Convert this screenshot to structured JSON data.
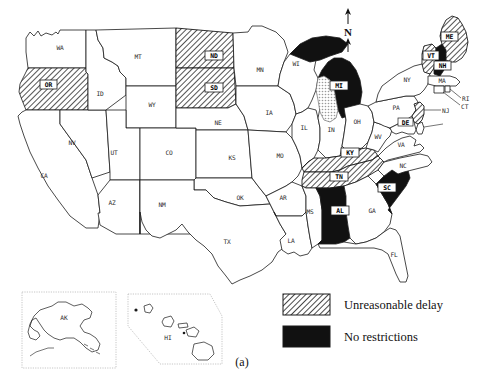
{
  "figure": {
    "caption": "(a)",
    "north_arrow_label": "N",
    "colors": {
      "outline": "#1a1a1a",
      "fill_none": "#ffffff",
      "fill_no_restrictions": "#111111",
      "hatch_stroke": "#1a1a1a",
      "background": "#ffffff",
      "lake_fill": "#d8d8d8"
    }
  },
  "legend": {
    "items": [
      {
        "label": "Unreasonable delay",
        "pattern": "hatch"
      },
      {
        "label": "No restrictions",
        "pattern": "solid-black"
      }
    ]
  },
  "insets": [
    {
      "name": "AK",
      "label": "AK",
      "shape": "rectangle"
    },
    {
      "name": "HI",
      "label": "HI",
      "shape": "hexagon"
    }
  ],
  "map": {
    "title": "",
    "categories": {
      "hatch": "Unreasonable delay",
      "black": "No restrictions",
      "white": "Other / not highlighted"
    },
    "states": [
      {
        "code": "WA",
        "label": "WA",
        "fill": "white",
        "boxed": false,
        "label_x": 60,
        "label_y": 50
      },
      {
        "code": "OR",
        "label": "OR",
        "fill": "hatch",
        "boxed": true,
        "label_x": 49,
        "label_y": 86
      },
      {
        "code": "CA",
        "label": "CA",
        "fill": "white",
        "boxed": false,
        "label_x": 44,
        "label_y": 178
      },
      {
        "code": "NV",
        "label": "NV",
        "fill": "white",
        "boxed": false,
        "label_x": 72,
        "label_y": 145
      },
      {
        "code": "ID",
        "label": "ID",
        "fill": "white",
        "boxed": false,
        "label_x": 100,
        "label_y": 96
      },
      {
        "code": "MT",
        "label": "MT",
        "fill": "white",
        "boxed": false,
        "label_x": 138,
        "label_y": 59
      },
      {
        "code": "WY",
        "label": "WY",
        "fill": "white",
        "boxed": false,
        "label_x": 152,
        "label_y": 107
      },
      {
        "code": "UT",
        "label": "UT",
        "fill": "white",
        "boxed": false,
        "label_x": 114,
        "label_y": 155
      },
      {
        "code": "AZ",
        "label": "AZ",
        "fill": "white",
        "boxed": false,
        "label_x": 112,
        "label_y": 205
      },
      {
        "code": "NM",
        "label": "NM",
        "fill": "white",
        "boxed": false,
        "label_x": 162,
        "label_y": 207
      },
      {
        "code": "CO",
        "label": "CO",
        "fill": "white",
        "boxed": false,
        "label_x": 169,
        "label_y": 155
      },
      {
        "code": "ND",
        "label": "ND",
        "fill": "hatch",
        "boxed": true,
        "label_x": 214,
        "label_y": 58
      },
      {
        "code": "SD",
        "label": "SD",
        "fill": "hatch",
        "boxed": true,
        "label_x": 214,
        "label_y": 90
      },
      {
        "code": "NE",
        "label": "NE",
        "fill": "white",
        "boxed": false,
        "label_x": 218,
        "label_y": 125
      },
      {
        "code": "KS",
        "label": "KS",
        "fill": "white",
        "boxed": false,
        "label_x": 232,
        "label_y": 160
      },
      {
        "code": "OK",
        "label": "OK",
        "fill": "white",
        "boxed": false,
        "label_x": 240,
        "label_y": 200
      },
      {
        "code": "TX",
        "label": "TX",
        "fill": "white",
        "boxed": false,
        "label_x": 227,
        "label_y": 244
      },
      {
        "code": "MN",
        "label": "MN",
        "fill": "white",
        "boxed": false,
        "label_x": 260,
        "label_y": 72
      },
      {
        "code": "IA",
        "label": "IA",
        "fill": "white",
        "boxed": false,
        "label_x": 269,
        "label_y": 115
      },
      {
        "code": "MO",
        "label": "MO",
        "fill": "white",
        "boxed": false,
        "label_x": 280,
        "label_y": 158
      },
      {
        "code": "AR",
        "label": "AR",
        "fill": "white",
        "boxed": false,
        "label_x": 283,
        "label_y": 200
      },
      {
        "code": "LA",
        "label": "LA",
        "fill": "white",
        "boxed": false,
        "label_x": 291,
        "label_y": 243
      },
      {
        "code": "WI",
        "label": "WI",
        "fill": "white",
        "boxed": false,
        "label_x": 296,
        "label_y": 66
      },
      {
        "code": "IL",
        "label": "IL",
        "fill": "white",
        "boxed": false,
        "label_x": 304,
        "label_y": 130
      },
      {
        "code": "IN",
        "label": "IN",
        "fill": "white",
        "boxed": false,
        "label_x": 330,
        "label_y": 130
      },
      {
        "code": "MI",
        "label": "MI",
        "fill": "black",
        "boxed": true,
        "label_x": 338,
        "label_y": 88
      },
      {
        "code": "OH",
        "label": "OH",
        "fill": "white",
        "boxed": false,
        "label_x": 357,
        "label_y": 122
      },
      {
        "code": "KY",
        "label": "KY",
        "fill": "hatch",
        "boxed": true,
        "label_x": 350,
        "label_y": 155
      },
      {
        "code": "TN",
        "label": "TN",
        "fill": "hatch",
        "boxed": true,
        "label_x": 339,
        "label_y": 179
      },
      {
        "code": "MS",
        "label": "MS",
        "fill": "white",
        "boxed": false,
        "label_x": 310,
        "label_y": 214
      },
      {
        "code": "AL",
        "label": "AL",
        "fill": "black",
        "boxed": true,
        "label_x": 340,
        "label_y": 213
      },
      {
        "code": "GA",
        "label": "GA",
        "fill": "white",
        "boxed": false,
        "label_x": 372,
        "label_y": 213
      },
      {
        "code": "FL",
        "label": "FL",
        "fill": "white",
        "boxed": false,
        "label_x": 394,
        "label_y": 257
      },
      {
        "code": "SC",
        "label": "SC",
        "fill": "black",
        "boxed": true,
        "label_x": 387,
        "label_y": 190
      },
      {
        "code": "NC",
        "label": "NC",
        "fill": "white",
        "boxed": false,
        "label_x": 400,
        "label_y": 168
      },
      {
        "code": "VA",
        "label": "VA",
        "fill": "white",
        "boxed": false,
        "label_x": 401,
        "label_y": 143
      },
      {
        "code": "WV",
        "label": "WV",
        "fill": "white",
        "boxed": false,
        "label_x": 376,
        "label_y": 139
      },
      {
        "code": "PA",
        "label": "PA",
        "fill": "white",
        "boxed": false,
        "label_x": 398,
        "label_y": 107
      },
      {
        "code": "NY",
        "label": "NY",
        "fill": "white",
        "boxed": false,
        "label_x": 407,
        "label_y": 80
      },
      {
        "code": "ME",
        "label": "ME",
        "fill": "hatch",
        "boxed": true,
        "label_x": 446,
        "label_y": 39
      },
      {
        "code": "VT",
        "label": "VT",
        "fill": "hatch",
        "boxed": true,
        "label_x": 431,
        "label_y": 58
      },
      {
        "code": "NH",
        "label": "NH",
        "fill": "black",
        "boxed": true,
        "label_x": 442,
        "label_y": 67
      },
      {
        "code": "NJ",
        "label": "NJ",
        "fill": "hatch",
        "boxed": false,
        "label_x": 444,
        "label_y": 111
      },
      {
        "code": "MA",
        "label": "MA",
        "fill": "white",
        "boxed": false,
        "label_x": 440,
        "label_y": 80
      },
      {
        "code": "RI",
        "label": "RI",
        "fill": "white",
        "boxed": false,
        "label_x": 464,
        "label_y": 99
      },
      {
        "code": "CT",
        "label": "CT",
        "fill": "white",
        "boxed": false,
        "label_x": 463,
        "label_y": 107
      },
      {
        "code": "MD",
        "label": "MD",
        "fill": "white",
        "boxed": false,
        "label_x": 408,
        "label_y": 124
      },
      {
        "code": "DE",
        "label": "DE",
        "fill": "white",
        "boxed": false,
        "label_x": 446,
        "label_y": 125
      }
    ],
    "highlighted": {
      "unreasonable_delay": [
        "OR",
        "ND",
        "SD",
        "KY",
        "TN",
        "ME",
        "VT",
        "NJ"
      ],
      "no_restrictions": [
        "MI",
        "AL",
        "SC",
        "NH"
      ]
    }
  }
}
